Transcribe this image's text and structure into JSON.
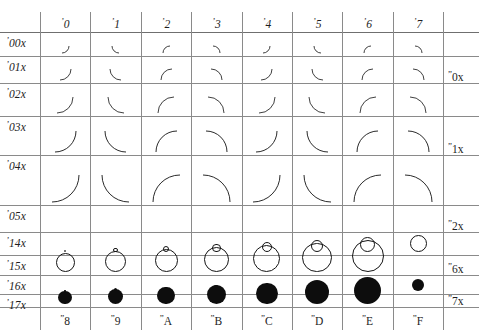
{
  "chart_data": {
    "type": "table",
    "column_headers_octal": [
      "'0",
      "'1",
      "'2",
      "'3",
      "'4",
      "'5",
      "'6",
      "'7"
    ],
    "column_headers_hex": [
      "\"8",
      "\"9",
      "\"A",
      "\"B",
      "\"C",
      "\"D",
      "\"E",
      "\"F"
    ],
    "row_headers_octal": [
      "'00x",
      "'01x",
      "'02x",
      "'03x",
      "'04x",
      "'05x",
      "'14x",
      "'15x",
      "'16x",
      "'17x"
    ],
    "row_headers_hex": [
      "\"0x",
      "\"1x",
      "\"2x",
      "\"6x",
      "\"7x"
    ],
    "rows": [
      {
        "octal": "'00x",
        "kind": "arc",
        "radius": 7,
        "cells": [
          "q4",
          "q3",
          "q1",
          "q2",
          "q4",
          "q3",
          "q1",
          "q2"
        ]
      },
      {
        "octal": "'01x",
        "kind": "arc",
        "radius": 11,
        "cells": [
          "q4",
          "q3",
          "q1",
          "q2",
          "q4",
          "q3",
          "q1",
          "q2"
        ]
      },
      {
        "octal": "'02x",
        "kind": "arc",
        "radius": 16,
        "cells": [
          "q4",
          "q3",
          "q1",
          "q2",
          "q4",
          "q3",
          "q1",
          "q2"
        ]
      },
      {
        "octal": "'03x",
        "kind": "arc",
        "radius": 21,
        "cells": [
          "q4",
          "q3",
          "q1",
          "q2",
          "q4",
          "q3",
          "q1",
          "q2"
        ]
      },
      {
        "octal": "'04x",
        "kind": "arc",
        "radius": 27,
        "cells": [
          "q4",
          "q3",
          "q1",
          "q2",
          "q4",
          "q3",
          "q1",
          "q2"
        ]
      },
      {
        "octal": "'05x",
        "kind": "empty",
        "cells": [
          "",
          "",
          "",
          "",
          "",
          "",
          "",
          ""
        ]
      },
      {
        "octal": "'14x",
        "kind": "hollow",
        "diameters": [
          2.5,
          4.5,
          6.5,
          8.5,
          10.5,
          12.5,
          15,
          17
        ]
      },
      {
        "octal": "'15x",
        "kind": "hollow",
        "diameters": [
          19,
          21,
          23,
          25,
          27,
          29.5,
          32,
          0
        ]
      },
      {
        "octal": "'16x",
        "kind": "solid",
        "diameters": [
          1.5,
          3,
          4.5,
          6,
          7.5,
          9,
          10.5,
          12
        ]
      },
      {
        "octal": "'17x",
        "kind": "solid",
        "diameters": [
          13.5,
          15.5,
          17.5,
          19.5,
          21.5,
          24,
          27,
          0
        ]
      }
    ],
    "hex_row_spans": [
      {
        "label": "\"0x",
        "at_row": 1
      },
      {
        "label": "\"1x",
        "at_row": 3
      },
      {
        "label": "\"2x",
        "at_row": 5
      },
      {
        "label": "\"6x",
        "at_row": 7
      },
      {
        "label": "\"7x",
        "at_row": 9
      }
    ],
    "grid": {
      "columns": 8,
      "rows": 10,
      "line_color": "#8a8a8a",
      "background": "#ffffff",
      "ink": "#1a1a1a"
    }
  }
}
